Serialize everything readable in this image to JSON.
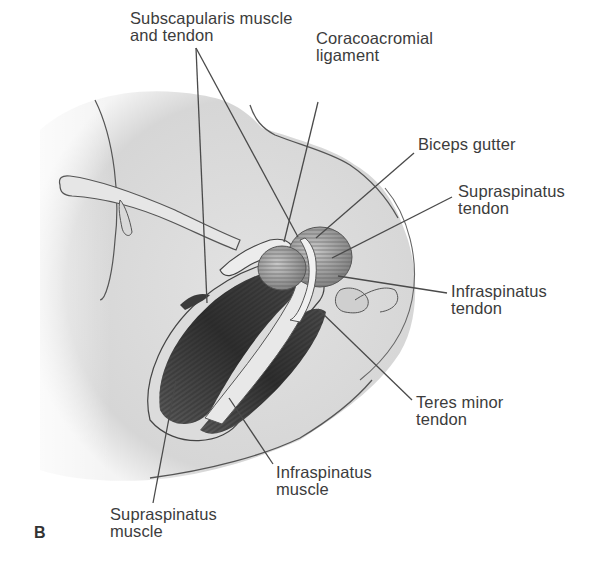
{
  "figure": {
    "panel_letter": "B",
    "labels": [
      {
        "id": "subscapularis",
        "line1": "Subscapularis muscle",
        "line2": "and tendon"
      },
      {
        "id": "coracoacromial",
        "line1": "Coracoacromial",
        "line2": "ligament"
      },
      {
        "id": "biceps-gutter",
        "line1": "Biceps gutter",
        "line2": ""
      },
      {
        "id": "supraspinatus-tendon",
        "line1": "Supraspinatus",
        "line2": "tendon"
      },
      {
        "id": "infraspinatus-tendon",
        "line1": "Infraspinatus",
        "line2": "tendon"
      },
      {
        "id": "teres-minor-tendon",
        "line1": "Teres minor",
        "line2": "tendon"
      },
      {
        "id": "infraspinatus-muscle",
        "line1": "Infraspinatus",
        "line2": "muscle"
      },
      {
        "id": "supraspinatus-muscle",
        "line1": "Supraspinatus",
        "line2": "muscle"
      }
    ]
  }
}
